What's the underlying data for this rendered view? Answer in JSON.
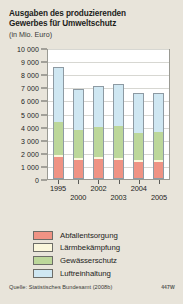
{
  "header": {
    "title_line1": "Ausgaben des produzierenden",
    "title_line2": "Gewerbes für Umweltschutz",
    "subtitle": "(in Mio. Euro)"
  },
  "footer": {
    "source": "Quelle: Statistisches Bundesamt (2008b)",
    "figure_id": "447W"
  },
  "colors": {
    "background": "#e8e4da",
    "plot_background": "#ffffff",
    "abfallentsorgung": "#ef9384",
    "laermbekaempfung": "#fbf7dc",
    "gewaesserschutz": "#bcd79a",
    "luftreinhaltung": "#cfe7f2",
    "axis": "#5c5c58",
    "grid": "#d7d7d2",
    "bar_outline": "#8d9aa3"
  },
  "chart_data": {
    "type": "bar",
    "stacked": true,
    "title": "Ausgaben des produzierenden Gewerbes für Umweltschutz",
    "subtitle": "(in Mio. Euro)",
    "xlabel": "",
    "ylabel": "",
    "unit": "Mio. Euro",
    "ylim": [
      0,
      10000
    ],
    "ytick_step": 1000,
    "grid": true,
    "legend_position": "below",
    "ytick_labels": [
      "0",
      "1 000",
      "2 000",
      "3 000",
      "4 000",
      "5 000",
      "6 000",
      "7 000",
      "8 000",
      "9 000",
      "10 000"
    ],
    "ytick_values": [
      0,
      1000,
      2000,
      3000,
      4000,
      5000,
      6000,
      7000,
      8000,
      9000,
      10000
    ],
    "categories": [
      "1995",
      "2000",
      "2002",
      "2003",
      "2004",
      "2005"
    ],
    "category_label_rows": [
      0,
      1,
      0,
      1,
      0,
      1
    ],
    "series": [
      {
        "name": "Abfallentsorgung",
        "color": "#ef9384",
        "values": [
          1620,
          1400,
          1480,
          1440,
          1260,
          1300
        ]
      },
      {
        "name": "Lärmbekämpfung",
        "color": "#fbf7dc",
        "values": [
          170,
          150,
          160,
          150,
          140,
          140
        ]
      },
      {
        "name": "Gewässerschutz",
        "color": "#bcd79a",
        "values": [
          2610,
          2250,
          2410,
          2500,
          2180,
          2250
        ]
      },
      {
        "name": "Luftreinhaltung",
        "color": "#cfe7f2",
        "values": [
          4300,
          3200,
          3150,
          3260,
          3120,
          2960
        ]
      }
    ],
    "totals": [
      8700,
      7000,
      7200,
      7350,
      6700,
      6650
    ]
  }
}
